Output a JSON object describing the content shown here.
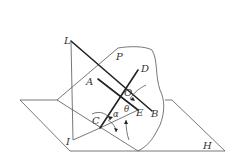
{
  "figure": {
    "planes": [
      {
        "name": "P",
        "label": "P"
      },
      {
        "name": "H",
        "label": "H"
      }
    ],
    "points": {
      "L": "L",
      "I": "I",
      "A": "A",
      "B": "B",
      "C": "C",
      "D": "D",
      "E": "E",
      "O": "O"
    },
    "angles": {
      "alpha": "α",
      "theta": "θ"
    }
  }
}
